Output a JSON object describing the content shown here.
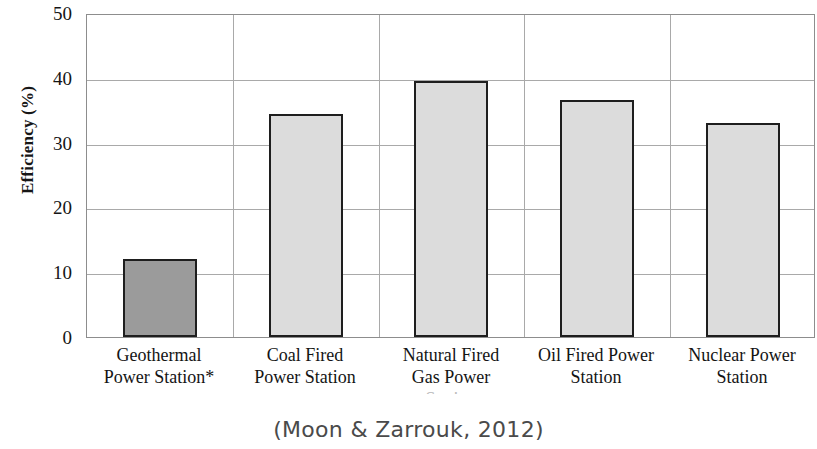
{
  "chart_data": {
    "type": "bar",
    "title": "",
    "subtitle": "",
    "xlabel": "",
    "ylabel": "Efficiency (%)",
    "categories": [
      "Geothermal Power Station*",
      "Coal Fired Power Station",
      "Natural Fired Gas Power Station",
      "Oil Fired Power Station",
      "Nuclear Power Station"
    ],
    "category_lines": [
      [
        "Geothermal",
        "Power Station*"
      ],
      [
        "Coal Fired",
        "Power Station"
      ],
      [
        "Natural Fired",
        "Gas Power",
        "Station"
      ],
      [
        "Oil Fired Power",
        "Station"
      ],
      [
        "Nuclear Power",
        "Station"
      ]
    ],
    "values": [
      12.0,
      34.4,
      39.5,
      36.5,
      33.0
    ],
    "ylim": [
      0,
      50
    ],
    "ytick_labels": [
      "0",
      "10",
      "20",
      "30",
      "40",
      "50"
    ],
    "ytick_values": [
      0,
      10,
      20,
      30,
      40,
      50
    ],
    "grid": "horizontal-and-vertical-category-separators",
    "legend": "none",
    "bar_colors": [
      "#9b9b9b",
      "#dcdcdc",
      "#dcdcdc",
      "#dcdcdc",
      "#dcdcdc"
    ],
    "bar_edge_color": "#1e1e1e",
    "highlighted_category": "Geothermal Power Station*"
  },
  "caption": {
    "text": "(Moon & Zarrouk, 2012)"
  },
  "colors": {
    "grid": "#a9a9a9",
    "frame": "#8d8d8d",
    "text": "#141414",
    "caption": "#4a4a4a",
    "bar_fill_light": "#dcdcdc",
    "bar_fill_dark": "#9b9b9b"
  }
}
